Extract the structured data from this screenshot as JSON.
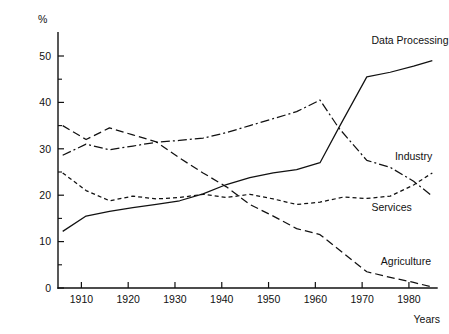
{
  "chart_data": {
    "type": "line",
    "title": "",
    "xlabel": "Years",
    "ylabel": "%",
    "xlim": [
      1905,
      1986
    ],
    "ylim": [
      0,
      55
    ],
    "grid": false,
    "legend_position": "inline-end-labels",
    "x_ticks": [
      1910,
      1920,
      1930,
      1940,
      1950,
      1960,
      1970,
      1980
    ],
    "x_tick_labels": [
      "1910",
      "1920",
      "1930",
      "1940",
      "1950",
      "1960",
      "1970",
      "1980"
    ],
    "y_ticks": [
      0,
      10,
      20,
      30,
      40,
      50
    ],
    "y_tick_labels": [
      "0",
      "10",
      "20",
      "30",
      "40",
      "50"
    ],
    "y_minor_ticks": [
      5,
      15,
      25,
      35,
      45
    ],
    "series": [
      {
        "name": "Data Processing",
        "style": "solid",
        "dash": "none",
        "label_x": 1972,
        "label_y": 52.5,
        "label_anchor": "start",
        "x": [
          1906,
          1911,
          1916,
          1921,
          1926,
          1931,
          1936,
          1941,
          1946,
          1951,
          1956,
          1961,
          1965,
          1971,
          1976,
          1981,
          1985
        ],
        "y": [
          12.2,
          15.5,
          16.5,
          17.3,
          18.0,
          18.8,
          20.3,
          22.3,
          23.8,
          24.8,
          25.5,
          27.0,
          34.5,
          45.5,
          46.5,
          47.8,
          49.0
        ]
      },
      {
        "name": "Industry",
        "style": "dash-dot",
        "dash": "9,3,2,3",
        "label_x": 1977,
        "label_y": 27.5,
        "label_anchor": "start",
        "x": [
          1906,
          1911,
          1916,
          1921,
          1926,
          1931,
          1936,
          1941,
          1946,
          1951,
          1956,
          1961,
          1965,
          1971,
          1976,
          1981,
          1985
        ],
        "y": [
          28.6,
          31.0,
          29.8,
          30.6,
          31.4,
          31.8,
          32.3,
          33.5,
          35.0,
          36.5,
          38.0,
          40.5,
          34.5,
          27.5,
          26.0,
          23.0,
          19.8
        ]
      },
      {
        "name": "Services",
        "style": "short-dash",
        "dash": "4,3",
        "label_x": 1972,
        "label_y": 16.5,
        "label_anchor": "start",
        "x": [
          1906,
          1911,
          1916,
          1921,
          1926,
          1931,
          1936,
          1941,
          1946,
          1951,
          1956,
          1961,
          1966,
          1971,
          1976,
          1981,
          1985
        ],
        "y": [
          24.8,
          21.0,
          18.8,
          19.8,
          19.2,
          19.5,
          20.2,
          19.5,
          20.2,
          19.2,
          18.0,
          18.5,
          19.6,
          19.3,
          19.8,
          22.2,
          24.8
        ]
      },
      {
        "name": "Agriculture",
        "style": "long-dash",
        "dash": "8,4",
        "label_x": 1974,
        "label_y": 5.0,
        "label_anchor": "start",
        "x": [
          1906,
          1911,
          1916,
          1921,
          1926,
          1931,
          1936,
          1941,
          1946,
          1951,
          1956,
          1961,
          1966,
          1971,
          1976,
          1981,
          1985
        ],
        "y": [
          35.0,
          32.0,
          34.5,
          33.0,
          31.5,
          28.0,
          24.8,
          21.8,
          18.0,
          15.5,
          12.8,
          11.5,
          7.5,
          3.5,
          2.3,
          1.2,
          0.2
        ]
      }
    ]
  },
  "axis": {
    "y_caption": "%",
    "x_caption": "Years"
  }
}
